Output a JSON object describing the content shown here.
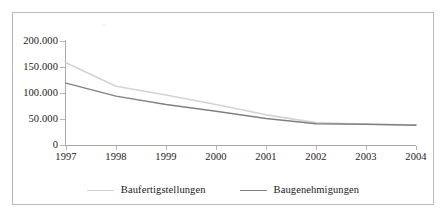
{
  "chart_data": {
    "type": "line",
    "title": "",
    "subtitle": "",
    "xlabel": "",
    "ylabel": "",
    "categories": [
      "1997",
      "1998",
      "1999",
      "2000",
      "2001",
      "2002",
      "2003",
      "2004"
    ],
    "x_tick_labels": [
      "1997",
      "1998",
      "1999",
      "2000",
      "2001",
      "2002",
      "2003",
      "2004"
    ],
    "y_tick_labels": [
      "200.000",
      "150.000",
      "100.000",
      "50.000",
      "0"
    ],
    "y_ticks": [
      200000,
      150000,
      100000,
      50000,
      0
    ],
    "ylim": [
      0,
      200000
    ],
    "grid": false,
    "legend_position": "bottom",
    "series": [
      {
        "name": "Baufertigstellungen",
        "color": "#d3d3d3",
        "values": [
          158000,
          113000,
          96000,
          78000,
          58000,
          43000,
          40000,
          39000
        ]
      },
      {
        "name": "Baugenehmigungen",
        "color": "#808080",
        "values": [
          119000,
          94000,
          78000,
          65000,
          51000,
          41000,
          40000,
          38000
        ]
      }
    ]
  },
  "legend": {
    "entries": [
      {
        "label": "Baufertigstellungen",
        "color": "#d3d3d3"
      },
      {
        "label": "Baugenehmigungen",
        "color": "#808080"
      }
    ]
  },
  "colors": {
    "series_light": "#d3d3d3",
    "series_dark": "#808080",
    "axis": "#a8a8a8",
    "frame": "#b9b9b9",
    "text": "#1a1a1a",
    "background": "#ffffff"
  }
}
